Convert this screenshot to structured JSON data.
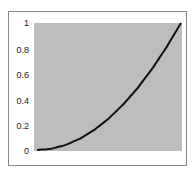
{
  "chart_data": {
    "type": "line",
    "title": "",
    "xlabel": "",
    "ylabel": "",
    "ylim": [
      0,
      1
    ],
    "grid": false,
    "legend": null,
    "y_ticks": [
      "0",
      "0.2",
      "0.4",
      "0.6",
      "0.8",
      "1"
    ],
    "x_ticks": [],
    "series": [
      {
        "name": "curve",
        "color": "#111111",
        "x": [
          0,
          0.1,
          0.2,
          0.3,
          0.4,
          0.5,
          0.6,
          0.7,
          0.8,
          0.9,
          1.0
        ],
        "values": [
          0,
          0.01,
          0.04,
          0.09,
          0.16,
          0.25,
          0.36,
          0.49,
          0.64,
          0.81,
          1.0
        ]
      }
    ],
    "plot_background": "#bdbdbd"
  }
}
